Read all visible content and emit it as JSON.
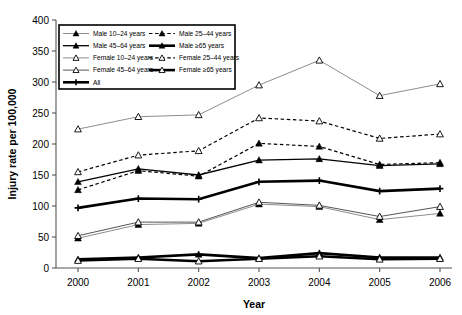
{
  "chart_data": {
    "type": "line",
    "title": "",
    "xlabel": "Year",
    "ylabel": "Injury rate per 100,000",
    "x": [
      2000,
      2001,
      2002,
      2003,
      2004,
      2005,
      2006
    ],
    "xtick_labels": [
      "2000",
      "2001",
      "2002",
      "2003",
      "2004",
      "2005",
      "2006"
    ],
    "ytick_labels": [
      "0",
      "50",
      "100",
      "150",
      "200",
      "250",
      "300",
      "350",
      "400"
    ],
    "yticks": [
      0,
      50,
      100,
      150,
      200,
      250,
      300,
      350,
      400
    ],
    "ylim": [
      0,
      400
    ],
    "grid": false,
    "legend_position": "upper-left-inside",
    "series": [
      {
        "name": "Male 10–24 years",
        "marker": "filled-triangle",
        "line": "solid-light",
        "values": [
          48,
          70,
          72,
          103,
          99,
          78,
          88
        ]
      },
      {
        "name": "Male 25–44 years",
        "marker": "filled-triangle",
        "line": "dashed",
        "values": [
          126,
          157,
          148,
          201,
          196,
          167,
          170
        ]
      },
      {
        "name": "Male 45–64 years",
        "marker": "filled-triangle",
        "line": "solid-dark",
        "values": [
          139,
          160,
          150,
          174,
          176,
          165,
          168
        ]
      },
      {
        "name": "Male ≥65 years",
        "marker": "filled-triangle",
        "line": "solid-thick",
        "values": [
          14,
          17,
          22,
          16,
          24,
          17,
          17
        ]
      },
      {
        "name": "Female 10–24 years",
        "marker": "open-triangle",
        "line": "solid-light",
        "values": [
          224,
          244,
          247,
          295,
          335,
          278,
          297
        ]
      },
      {
        "name": "Female 25–44 years",
        "marker": "open-triangle",
        "line": "dashed",
        "values": [
          155,
          182,
          189,
          242,
          237,
          209,
          216
        ]
      },
      {
        "name": "Female 45–64 years",
        "marker": "open-triangle",
        "line": "solid-mid",
        "values": [
          52,
          74,
          74,
          106,
          101,
          83,
          99
        ]
      },
      {
        "name": "Female ≥65 years",
        "marker": "open-triangle",
        "line": "solid-thick",
        "values": [
          12,
          15,
          11,
          15,
          19,
          14,
          15
        ]
      },
      {
        "name": "All",
        "marker": "plus",
        "line": "solid-thick",
        "values": [
          97,
          112,
          111,
          139,
          141,
          124,
          128
        ]
      }
    ],
    "legend_entries": [
      {
        "label": "Male 10–24 years",
        "style": "solid-light",
        "marker": "filled-triangle"
      },
      {
        "label": "Male 25–44 years",
        "style": "dashed",
        "marker": "filled-triangle"
      },
      {
        "label": "Male 45–64 years",
        "style": "solid-dark",
        "marker": "filled-triangle"
      },
      {
        "label": "Male ≥65 years",
        "style": "solid-thick",
        "marker": "filled-triangle"
      },
      {
        "label": "Female 10–24 years",
        "style": "solid-light",
        "marker": "open-triangle"
      },
      {
        "label": "Female 25–44 years",
        "style": "dashed",
        "marker": "open-triangle"
      },
      {
        "label": "Female 45–64 years",
        "style": "solid-mid",
        "marker": "open-triangle"
      },
      {
        "label": "Female ≥65 years",
        "style": "solid-thick",
        "marker": "open-triangle"
      },
      {
        "label": "All",
        "style": "solid-thick",
        "marker": "plus"
      }
    ],
    "colors": {
      "line": "#000000",
      "light_line": "#8d8d8d",
      "axis": "#555555",
      "background": "#ffffff"
    }
  }
}
